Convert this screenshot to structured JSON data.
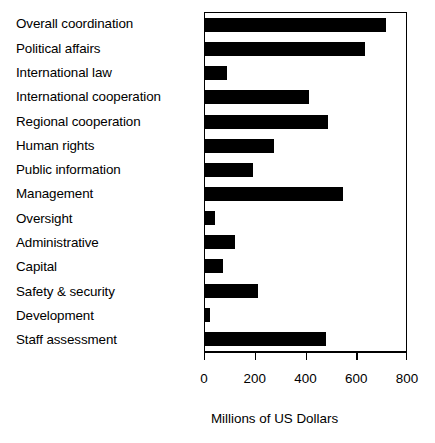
{
  "chart_data": {
    "type": "bar",
    "orientation": "horizontal",
    "title": "",
    "xlabel": "Millions of US Dollars",
    "ylabel": "",
    "xlim": [
      0,
      800
    ],
    "xticks": [
      0,
      200,
      400,
      600,
      800
    ],
    "xticklabels": [
      "0",
      "200",
      "400",
      "600",
      "800"
    ],
    "grid": false,
    "legend": null,
    "bar_color": "#000000",
    "frame_color": "#000000",
    "background": "#ffffff",
    "categories": [
      "Overall coordination",
      "Political affairs",
      "International law",
      "International cooperation",
      "Regional cooperation",
      "Human rights",
      "Public information",
      "Management",
      "Oversight",
      "Administrative",
      "Capital",
      "Safety & security",
      "Development",
      "Staff assessment"
    ],
    "values": [
      715,
      630,
      85,
      410,
      485,
      270,
      190,
      545,
      40,
      120,
      70,
      210,
      20,
      475
    ]
  }
}
